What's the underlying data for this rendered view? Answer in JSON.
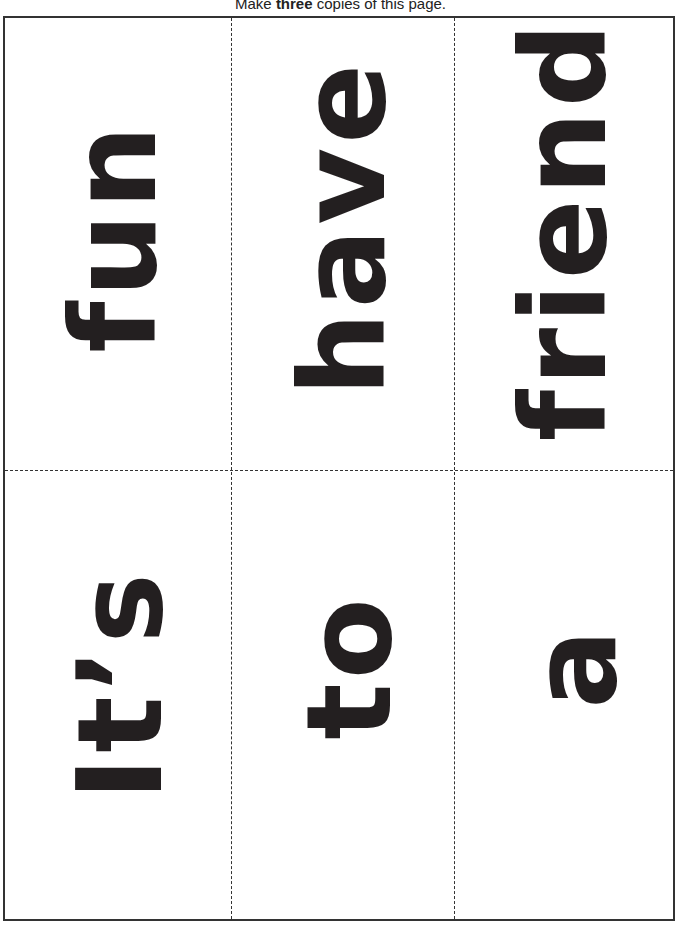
{
  "instruction": {
    "prefix": "Make ",
    "emphasis": "three",
    "suffix": " copies of this page."
  },
  "cards": [
    {
      "word": "fun"
    },
    {
      "word": "have"
    },
    {
      "word": "friend"
    },
    {
      "word": "It’s"
    },
    {
      "word": "to"
    },
    {
      "word": "a"
    }
  ],
  "colors": {
    "ink": "#231f20",
    "border": "#333333",
    "background": "#ffffff"
  },
  "layout": {
    "text_rotation": "-90deg",
    "grid": "3 columns x 2 rows",
    "cut_lines": "dashed"
  }
}
